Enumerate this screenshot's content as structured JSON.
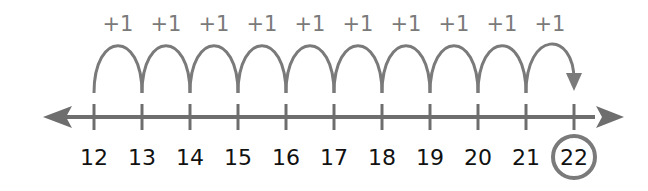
{
  "diagram": {
    "type": "number-line-counting-on",
    "start": 12,
    "end": 22,
    "ticks": [
      "12",
      "13",
      "14",
      "15",
      "16",
      "17",
      "18",
      "19",
      "20",
      "21",
      "22"
    ],
    "jumps": [
      "+1",
      "+1",
      "+1",
      "+1",
      "+1",
      "+1",
      "+1",
      "+1",
      "+1",
      "+1"
    ],
    "answer": "22",
    "colors": {
      "line": "#6e6e6e",
      "arc": "#7a7a7a",
      "text": "#111111",
      "label": "#7a7a7a",
      "circle": "#7a7a7a"
    }
  }
}
